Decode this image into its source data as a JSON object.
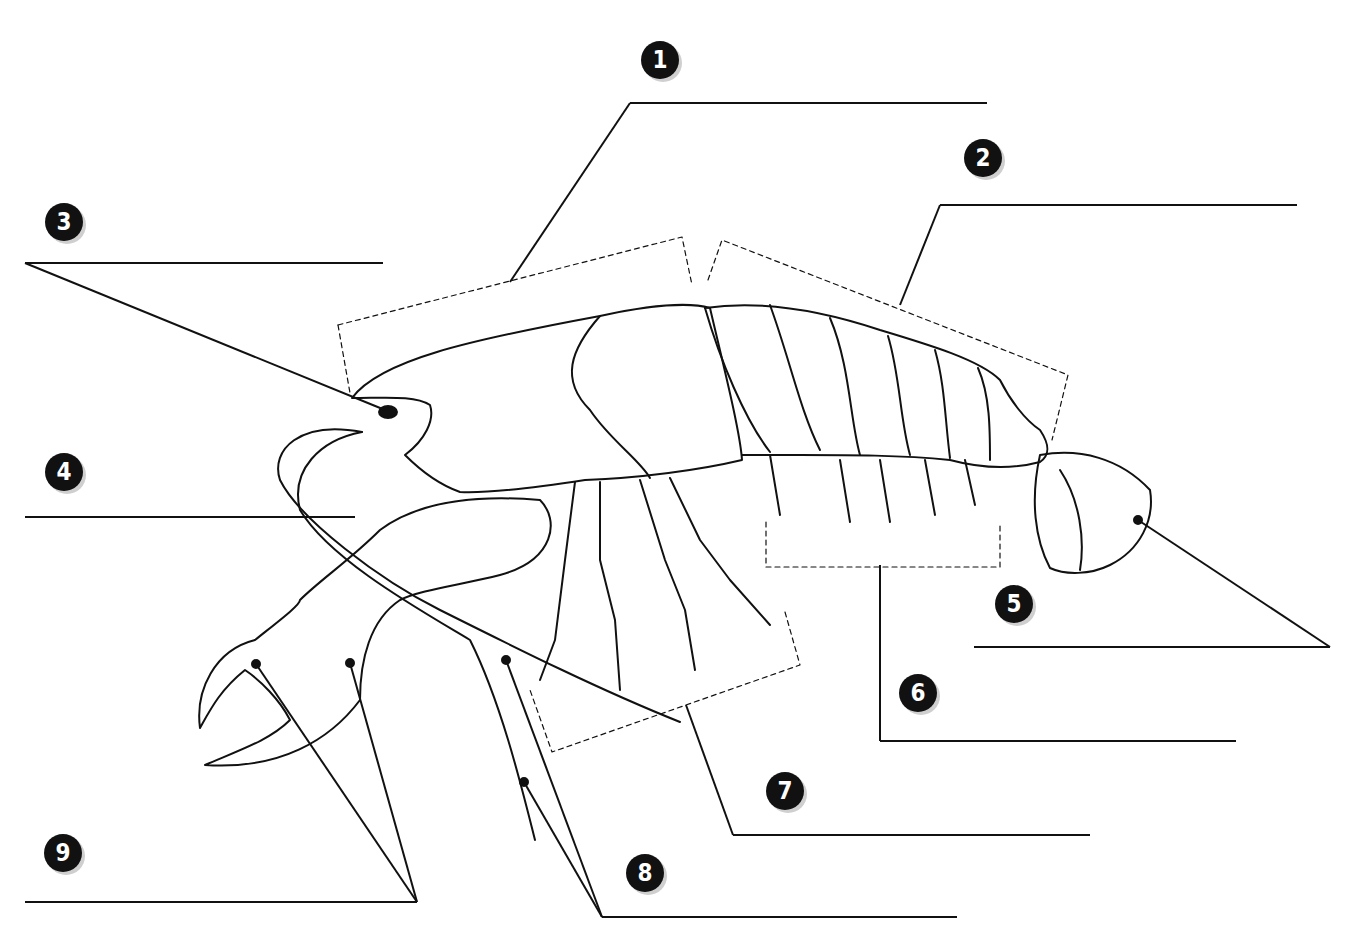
{
  "colors": {
    "ink": "#111111",
    "badge_bg": "#111111",
    "badge_text": "#ffffff",
    "shadow": "#cfcfcf"
  },
  "labels": [
    {
      "num": "1",
      "badge": [
        660,
        60
      ],
      "line": [
        [
          630,
          103
        ],
        [
          987,
          103
        ]
      ],
      "leader": [
        [
          630,
          103
        ],
        [
          510,
          282
        ]
      ]
    },
    {
      "num": "2",
      "badge": [
        983,
        158
      ],
      "line": [
        [
          940,
          205
        ],
        [
          1297,
          205
        ]
      ],
      "leader": [
        [
          940,
          205
        ],
        [
          900,
          305
        ]
      ]
    },
    {
      "num": "3",
      "badge": [
        64,
        222
      ],
      "line": [
        [
          25,
          263
        ],
        [
          383,
          263
        ]
      ],
      "leader": [
        [
          25,
          263
        ],
        [
          385,
          410
        ]
      ]
    },
    {
      "num": "4",
      "badge": [
        64,
        472
      ],
      "line": [
        [
          25,
          517
        ],
        [
          355,
          517
        ]
      ],
      "leader": null
    },
    {
      "num": "5",
      "badge": [
        1014,
        604
      ],
      "line": [
        [
          974,
          647
        ],
        [
          1330,
          647
        ]
      ],
      "leader": [
        [
          1330,
          647
        ],
        [
          1138,
          520
        ]
      ]
    },
    {
      "num": "6",
      "badge": [
        918,
        693
      ],
      "line": [
        [
          880,
          741
        ],
        [
          1236,
          741
        ]
      ],
      "leader": [
        [
          880,
          741
        ],
        [
          880,
          565
        ]
      ]
    },
    {
      "num": "7",
      "badge": [
        785,
        791
      ],
      "line": [
        [
          733,
          835
        ],
        [
          1090,
          835
        ]
      ],
      "leader": [
        [
          733,
          835
        ],
        [
          686,
          705
        ]
      ]
    },
    {
      "num": "8",
      "badge": [
        645,
        873
      ],
      "line": [
        [
          602,
          917
        ],
        [
          957,
          917
        ]
      ],
      "leader": [
        [
          602,
          917
        ],
        [
          506,
          660
        ]
      ],
      "leader2": [
        [
          602,
          917
        ],
        [
          524,
          782
        ]
      ]
    },
    {
      "num": "9",
      "badge": [
        63,
        853
      ],
      "line": [
        [
          25,
          902
        ],
        [
          417,
          902
        ]
      ],
      "leader": [
        [
          417,
          902
        ],
        [
          256,
          664
        ]
      ],
      "leader2": [
        [
          417,
          902
        ],
        [
          350,
          663
        ]
      ]
    }
  ]
}
